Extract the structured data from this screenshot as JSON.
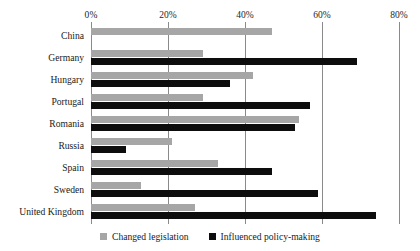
{
  "chart_data": {
    "type": "bar",
    "orientation": "horizontal",
    "title": "",
    "subtitle": "",
    "xlabel": "",
    "ylabel": "",
    "xlim": [
      0,
      80
    ],
    "xticks": [
      0,
      20,
      40,
      60,
      80
    ],
    "xtick_labels": [
      "0%",
      "20%",
      "40%",
      "60%",
      "80%"
    ],
    "grid": true,
    "grid_axis": "x",
    "legend_position": "bottom",
    "categories": [
      "China",
      "Germany",
      "Hungary",
      "Portugal",
      "Romania",
      "Russia",
      "Spain",
      "Sweden",
      "United Kingdom"
    ],
    "series": [
      {
        "name": "Changed legislation",
        "color": "#a6a6a6",
        "values": [
          47,
          29,
          42,
          29,
          54,
          21,
          33,
          13,
          27
        ]
      },
      {
        "name": "Influenced policy-making",
        "color": "#0d0d0d",
        "values": [
          null,
          69,
          36,
          57,
          53,
          9,
          47,
          59,
          74
        ]
      }
    ]
  },
  "legend": {
    "items": [
      {
        "label": "Changed legislation",
        "swatch": "gray-square-icon"
      },
      {
        "label": "Influenced policy-making",
        "swatch": "black-square-icon"
      }
    ]
  },
  "colors": {
    "series_changed_legislation": "#a6a6a6",
    "series_influenced_policy": "#0d0d0d",
    "gridline": "#8a8a8a",
    "text": "#1a1a1a",
    "background": "#ffffff"
  }
}
